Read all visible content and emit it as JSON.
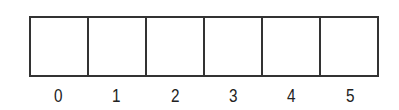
{
  "diagram": {
    "type": "array",
    "cells": [
      "",
      "",
      "",
      "",
      "",
      ""
    ],
    "indices": [
      "0",
      "1",
      "2",
      "3",
      "4",
      "5"
    ]
  }
}
